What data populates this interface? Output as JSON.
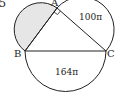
{
  "question_number": "5",
  "points": {
    "A": {
      "label": "A",
      "x": 57,
      "y": 8
    },
    "B": {
      "label": "B",
      "x": 25,
      "y": 51
    },
    "C": {
      "label": "C",
      "x": 106,
      "y": 51
    }
  },
  "semicircles": {
    "AC": {
      "label": "100π"
    },
    "BC": {
      "label": "164π"
    },
    "AB": {
      "label": "",
      "shaded": true,
      "fill": "#e6e6e6"
    }
  },
  "right_angle_at": "A",
  "colors": {
    "stroke": "#222222",
    "shade": "#e6e6e6"
  }
}
